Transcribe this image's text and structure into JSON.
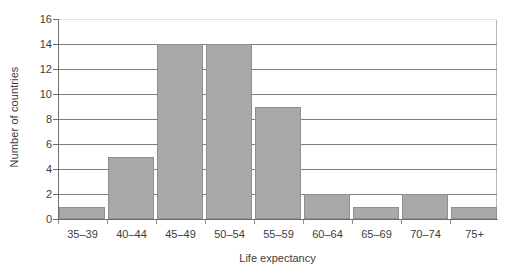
{
  "chart_data": {
    "type": "bar",
    "title": "",
    "subtitle": "",
    "xlabel": "Life expectancy",
    "ylabel": "Number of countries",
    "categories": [
      "35–39",
      "40–44",
      "45–49",
      "50–54",
      "55–59",
      "60–64",
      "65–69",
      "70–74",
      "75+"
    ],
    "values": [
      1,
      5,
      14,
      14,
      9,
      2,
      1,
      2,
      1
    ],
    "ylim": [
      0,
      16
    ],
    "ytick_labels": [
      "0",
      "2",
      "4",
      "6",
      "8",
      "10",
      "12",
      "14",
      "16"
    ],
    "ytick_values": [
      0,
      2,
      4,
      6,
      8,
      10,
      12,
      14,
      16
    ],
    "ystep": 2,
    "grid": "horizontal",
    "legend": "none",
    "bar_color": "#a9a9a9",
    "bar_border_color": "#8f8f8f",
    "gridline_color": "#7e7e7e",
    "axis_color": "#6f6f6f",
    "text_color": "#3d3d3d",
    "background": "#ffffff",
    "annotations": []
  }
}
